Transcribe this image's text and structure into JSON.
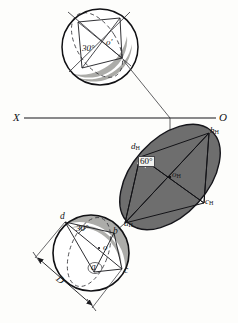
{
  "figure": {
    "background_color": "#fdfdfb",
    "ink_color": "#16161a",
    "ellipse_fill": "#6e6e6e",
    "crescent_fill": "#a8a8a4",
    "circle_fill": "#ffffff"
  },
  "axis": {
    "left_label": "X",
    "right_label": "O",
    "y": 118
  },
  "front_view": {
    "name": "frontal projection",
    "center_label": "o",
    "center_prime": "'",
    "angle_label": "30",
    "angle_degree": "°"
  },
  "top_view": {
    "name": "horizontal projection ellipse",
    "angle_label": "60",
    "angle_degree": "°",
    "vertices": [
      {
        "id": "a",
        "label": "a",
        "sub": "H"
      },
      {
        "id": "b",
        "label": "b",
        "sub": "H"
      },
      {
        "id": "c",
        "label": "c",
        "sub": "H"
      },
      {
        "id": "d",
        "label": "d",
        "sub": "H"
      },
      {
        "id": "o",
        "label": "o",
        "sub": "H"
      }
    ]
  },
  "profile_view": {
    "name": "true shape circle",
    "angle_label": "30",
    "angle_degree": "°",
    "diameter_label": "D",
    "vertices": [
      {
        "id": "a",
        "label": "a"
      },
      {
        "id": "b",
        "label": "b"
      },
      {
        "id": "c",
        "label": "c"
      },
      {
        "id": "d",
        "label": "d"
      },
      {
        "id": "o",
        "label": "o"
      }
    ]
  }
}
